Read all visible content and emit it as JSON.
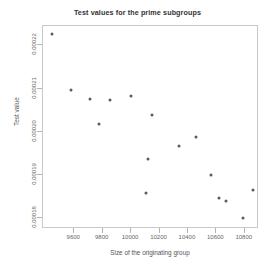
{
  "chart_data": {
    "type": "scatter",
    "title": "Test values for the prime subgroups",
    "xlabel": "Size of the originating group",
    "ylabel": "Test value",
    "xlim": [
      9380,
      10900
    ],
    "ylim": [
      0.0001775,
      0.0002245
    ],
    "grid": false,
    "legend": null,
    "xticks": [
      9600,
      9800,
      10000,
      10200,
      10400,
      10600,
      10800
    ],
    "xtick_labels": [
      "9600",
      "9800",
      "10000",
      "10200",
      "10400",
      "10600",
      "10800"
    ],
    "yticks": [
      0.00018,
      0.00019,
      0.0002,
      0.00021,
      0.00022
    ],
    "ytick_labels": [
      "0.00018",
      "0.00019",
      "0.00020",
      "0.00021",
      "0.00022"
    ],
    "marker": "filled-circle",
    "marker_color": "#5b5b5b",
    "points": [
      {
        "x": 9440,
        "y": 0.0002227
      },
      {
        "x": 9578,
        "y": 0.0002096
      },
      {
        "x": 9712,
        "y": 0.0002076
      },
      {
        "x": 9848,
        "y": 0.0002074
      },
      {
        "x": 9775,
        "y": 0.0002018
      },
      {
        "x": 10000,
        "y": 0.0002084
      },
      {
        "x": 10150,
        "y": 0.0002038
      },
      {
        "x": 10120,
        "y": 0.0001937
      },
      {
        "x": 10335,
        "y": 0.0001967
      },
      {
        "x": 10455,
        "y": 0.0001989
      },
      {
        "x": 10105,
        "y": 0.0001859
      },
      {
        "x": 10565,
        "y": 0.00019
      },
      {
        "x": 10615,
        "y": 0.0001846
      },
      {
        "x": 10665,
        "y": 0.0001839
      },
      {
        "x": 10790,
        "y": 0.00018
      },
      {
        "x": 10855,
        "y": 0.0001866
      }
    ]
  },
  "colors": {
    "background": "#ffffff",
    "axis": "#c8c8c8",
    "text": "#555555",
    "marker": "#5b5b5b"
  }
}
